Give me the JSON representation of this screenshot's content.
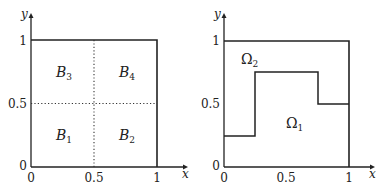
{
  "left_plot": {
    "axis": {
      "x_label": "x",
      "y_label": "y"
    },
    "x_ticks": [
      "0",
      "0.5",
      "1"
    ],
    "y_ticks": [
      "0",
      "0.5",
      "1"
    ],
    "regions": [
      {
        "name": "B",
        "sub": "1"
      },
      {
        "name": "B",
        "sub": "2"
      },
      {
        "name": "B",
        "sub": "3"
      },
      {
        "name": "B",
        "sub": "4"
      }
    ],
    "description": "Unit square split by dotted lines at x=0.5 and y=0.5 into four blocks"
  },
  "right_plot": {
    "axis": {
      "x_label": "x",
      "y_label": "y"
    },
    "x_ticks": [
      "0",
      "0.5",
      "1"
    ],
    "y_ticks": [
      "0",
      "0.5",
      "1"
    ],
    "regions": [
      {
        "name": "Ω",
        "sub": "1"
      },
      {
        "name": "Ω",
        "sub": "2"
      }
    ],
    "interface_points": [
      [
        0,
        0.25
      ],
      [
        0.25,
        0.25
      ],
      [
        0.25,
        0.75
      ],
      [
        0.75,
        0.75
      ],
      [
        0.75,
        0.5
      ],
      [
        1,
        0.5
      ]
    ],
    "description": "Unit square divided by a staircase interface into Ω1 (lower) and Ω2 (upper)"
  }
}
